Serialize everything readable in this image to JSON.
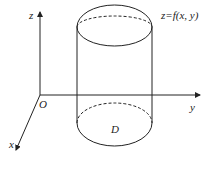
{
  "diagram": {
    "labels": {
      "z_axis": "z",
      "y_axis": "y",
      "x_axis": "x",
      "origin": "O",
      "surface": "z=f(x, y)",
      "region": "D"
    }
  }
}
